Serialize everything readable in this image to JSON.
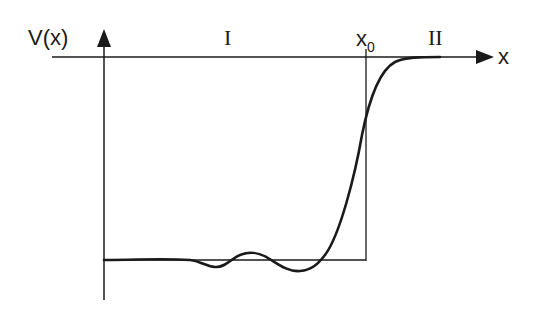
{
  "diagram": {
    "y_axis_label": "V(x)",
    "x_axis_label": "x",
    "boundary_label": "x",
    "boundary_subscript": "0",
    "region_labels": [
      "I",
      "II"
    ],
    "elements": [
      {
        "type": "axis",
        "name": "y-axis",
        "direction": "up"
      },
      {
        "type": "axis",
        "name": "x-axis",
        "direction": "right"
      },
      {
        "type": "line",
        "name": "square-well-boundary",
        "at": "x0"
      },
      {
        "type": "line",
        "name": "square-well-bottom"
      },
      {
        "type": "curve",
        "name": "smooth-potential",
        "description": "flat with small oscillations in region I, rises steeply near x0, saturates at zero in region II"
      }
    ],
    "colors": {
      "stroke": "#1a1a1a",
      "background": "#ffffff"
    }
  }
}
